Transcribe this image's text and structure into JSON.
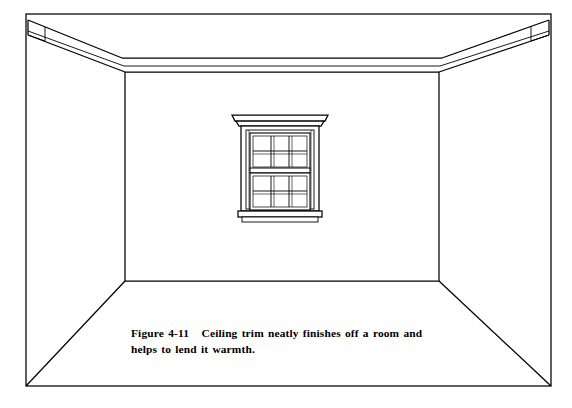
{
  "figure": {
    "caption_label": "Figure 4-11",
    "caption_gap": "   ",
    "caption_text": "Ceiling trim neatly finishes off a room and helps to lend it warmth.",
    "caption_full": "Figure 4-11   Ceiling trim neatly finishes off a room and helps to lend it warmth.",
    "line_color": "#000000",
    "fill_color": "#ffffff",
    "background_color": "#ffffff"
  },
  "scene": {
    "title": "Room interior in one-point perspective",
    "border": {
      "name": "figure-border",
      "left": 26,
      "top": 14,
      "right": 551,
      "bottom": 386
    },
    "vanishing_box": {
      "name": "back-wall",
      "left": 125,
      "top": 72,
      "right": 439,
      "bottom": 281
    },
    "elements": [
      {
        "name": "left-wall",
        "label": "Left wall"
      },
      {
        "name": "right-wall",
        "label": "Right wall"
      },
      {
        "name": "back-wall",
        "label": "Back wall"
      },
      {
        "name": "ceiling",
        "label": "Ceiling"
      },
      {
        "name": "floor",
        "label": "Floor"
      },
      {
        "name": "ceiling-trim-back",
        "label": "Ceiling trim (back wall)"
      },
      {
        "name": "ceiling-trim-left",
        "label": "Ceiling trim (left wall)"
      },
      {
        "name": "ceiling-trim-right",
        "label": "Ceiling trim (right wall)"
      },
      {
        "name": "window",
        "label": "Double-hung window"
      }
    ]
  },
  "window": {
    "name": "double-hung-window",
    "label": "Double-hung window with decorative head casing",
    "casing": {
      "left": 240,
      "top": 122,
      "right": 320,
      "bottom": 222
    },
    "head_casing": {
      "label": "Head casing / cornice",
      "left": 233,
      "top": 115,
      "right": 327,
      "bottom": 124
    },
    "sill": {
      "label": "Sill and apron",
      "top": 210,
      "bottom": 222
    },
    "sashes": [
      {
        "name": "upper-sash",
        "rows": 2,
        "cols": 3,
        "panes": 6
      },
      {
        "name": "lower-sash",
        "rows": 2,
        "cols": 3,
        "panes": 6
      }
    ],
    "meeting_rail_y": 170,
    "total_panes": 12
  }
}
